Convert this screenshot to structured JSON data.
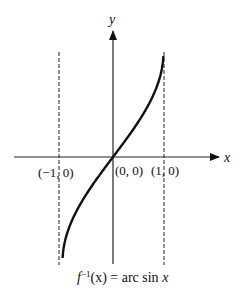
{
  "chart_data": {
    "type": "line",
    "title": "",
    "caption": "f⁻¹(x) = arc sin x",
    "caption_parts": {
      "func": "f",
      "sup": "−1",
      "arg": "(x) = arc sin ",
      "var": "x"
    },
    "xlabel": "x",
    "ylabel": "y",
    "series": [
      {
        "name": "arcsin x",
        "x": [
          -1,
          -0.9,
          -0.7,
          -0.5,
          -0.3,
          0,
          0.3,
          0.5,
          0.7,
          0.9,
          1
        ],
        "y": [
          -1.571,
          -1.12,
          -0.775,
          -0.524,
          -0.305,
          0,
          0.305,
          0.524,
          0.775,
          1.12,
          1.571
        ]
      }
    ],
    "asymptotes_dashed": [
      -1,
      1
    ],
    "points": [
      {
        "label": "(−1, 0)",
        "x": -1,
        "y": 0
      },
      {
        "label": "(0, 0)",
        "x": 0,
        "y": 0
      },
      {
        "label": "(1, 0)",
        "x": 1,
        "y": 0
      }
    ],
    "xlim": [
      -1.2,
      2.0
    ],
    "ylim": [
      -1.6,
      1.8
    ],
    "grid": false,
    "legend": "none"
  }
}
